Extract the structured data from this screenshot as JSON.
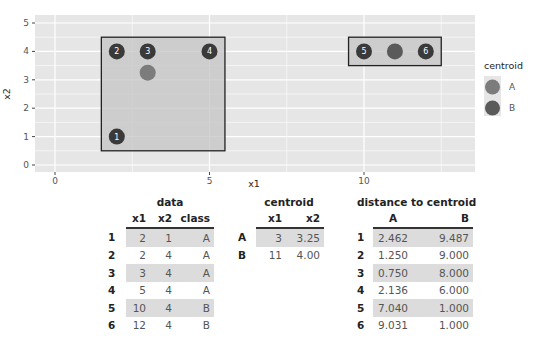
{
  "chart_data": {
    "type": "scatter",
    "title": "",
    "xlabel": "x1",
    "ylabel": "x2",
    "xlim": [
      -0.65,
      13.6
    ],
    "ylim": [
      -0.25,
      5.25
    ],
    "x_ticks": [
      0,
      5,
      10
    ],
    "y_ticks": [
      0,
      1,
      2,
      3,
      4,
      5
    ],
    "grid": true,
    "legend": {
      "title": "centroid",
      "position": "right",
      "entries": [
        "A",
        "B"
      ]
    },
    "points": [
      {
        "id": 1,
        "x1": 2,
        "x2": 1,
        "class": "A"
      },
      {
        "id": 2,
        "x1": 2,
        "x2": 4,
        "class": "A"
      },
      {
        "id": 3,
        "x1": 3,
        "x2": 4,
        "class": "A"
      },
      {
        "id": 4,
        "x1": 5,
        "x2": 4,
        "class": "A"
      },
      {
        "id": 5,
        "x1": 10,
        "x2": 4,
        "class": "B"
      },
      {
        "id": 6,
        "x1": 12,
        "x2": 4,
        "class": "B"
      }
    ],
    "centroids": [
      {
        "name": "A",
        "x1": 3,
        "x2": 3.25
      },
      {
        "name": "B",
        "x1": 11,
        "x2": 4.0
      }
    ],
    "boxes": [
      {
        "class": "A",
        "xmin": 1.5,
        "xmax": 5.5,
        "ymin": 0.5,
        "ymax": 4.5
      },
      {
        "class": "B",
        "xmin": 9.5,
        "xmax": 12.5,
        "ymin": 3.5,
        "ymax": 4.5
      }
    ]
  },
  "colors": {
    "panel_bg": "#e6e6e6",
    "grid": "#ffffff",
    "box_fill": "#c4c4c4",
    "box_border": "#222222",
    "point": "#3a3a3a",
    "centroid_A": "#7c7c7c",
    "centroid_B": "#5a5a5a"
  },
  "tables": {
    "data": {
      "title": "data",
      "columns": [
        "x1",
        "x2",
        "class"
      ],
      "rows": [
        {
          "rn": "1",
          "x1": "2",
          "x2": "1",
          "class": "A"
        },
        {
          "rn": "2",
          "x1": "2",
          "x2": "4",
          "class": "A"
        },
        {
          "rn": "3",
          "x1": "3",
          "x2": "4",
          "class": "A"
        },
        {
          "rn": "4",
          "x1": "5",
          "x2": "4",
          "class": "A"
        },
        {
          "rn": "5",
          "x1": "10",
          "x2": "4",
          "class": "B"
        },
        {
          "rn": "6",
          "x1": "12",
          "x2": "4",
          "class": "B"
        }
      ]
    },
    "centroid": {
      "title": "centroid",
      "columns": [
        "x1",
        "x2"
      ],
      "rows": [
        {
          "rn": "A",
          "x1": "3",
          "x2": "3.25"
        },
        {
          "rn": "B",
          "x1": "11",
          "x2": "4.00"
        }
      ]
    },
    "distance": {
      "title": "distance to centroid",
      "columns": [
        "A",
        "B"
      ],
      "rows": [
        {
          "rn": "1",
          "A": "2.462",
          "B": "9.487"
        },
        {
          "rn": "2",
          "A": "1.250",
          "B": "9.000"
        },
        {
          "rn": "3",
          "A": "0.750",
          "B": "8.000"
        },
        {
          "rn": "4",
          "A": "2.136",
          "B": "6.000"
        },
        {
          "rn": "5",
          "A": "7.040",
          "B": "1.000"
        },
        {
          "rn": "6",
          "A": "9.031",
          "B": "1.000"
        }
      ]
    }
  }
}
